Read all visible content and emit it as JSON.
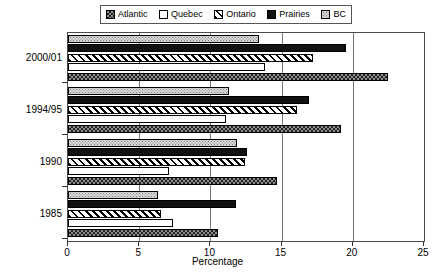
{
  "chart_data": {
    "type": "bar",
    "orientation": "horizontal",
    "title": "",
    "xlabel": "Percentage",
    "ylabel": "Survey",
    "categories": [
      "1985",
      "1990",
      "1994/95",
      "2000/01"
    ],
    "xlim": [
      0,
      25
    ],
    "xticks": [
      0,
      5,
      10,
      15,
      20,
      25
    ],
    "grid": true,
    "legend_position": "top",
    "series": [
      {
        "name": "Atlantic",
        "pattern": "checkered",
        "values": [
          10.5,
          14.7,
          19.2,
          22.5
        ]
      },
      {
        "name": "Quebec",
        "pattern": "empty",
        "values": [
          7.4,
          7.1,
          11.1,
          13.8
        ]
      },
      {
        "name": "Ontario",
        "pattern": "diagonal",
        "values": [
          6.5,
          12.4,
          16.1,
          17.2
        ]
      },
      {
        "name": "Prairies",
        "pattern": "solid",
        "values": [
          11.8,
          12.6,
          16.9,
          19.5
        ]
      },
      {
        "name": "BC",
        "pattern": "dotted",
        "values": [
          6.3,
          11.9,
          11.3,
          13.4
        ]
      }
    ]
  },
  "legend": {
    "items": [
      {
        "label": "Atlantic"
      },
      {
        "label": "Quebec"
      },
      {
        "label": "Ontario"
      },
      {
        "label": "Prairies"
      },
      {
        "label": "BC"
      }
    ]
  },
  "axes": {
    "x_title": "Percentage",
    "y_title": "Survey",
    "x_tick_labels": [
      "0",
      "5",
      "10",
      "15",
      "20",
      "25"
    ],
    "y_tick_labels": [
      "1985",
      "1990",
      "1994/95",
      "2000/01"
    ]
  }
}
